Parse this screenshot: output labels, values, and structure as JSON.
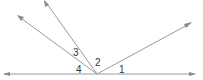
{
  "diagram": {
    "type": "angles-at-a-point",
    "vertex": {
      "x": 97,
      "y": 74
    },
    "line": {
      "x1": 4,
      "y1": 74,
      "x2": 195,
      "y2": 74
    },
    "rays": [
      {
        "name": "ray-left-upper",
        "x": 18,
        "y": 16
      },
      {
        "name": "ray-steep",
        "x": 45,
        "y": 1
      },
      {
        "name": "ray-right",
        "x": 191,
        "y": 23
      }
    ],
    "labels": [
      {
        "text": "1",
        "x": 119,
        "y": 73
      },
      {
        "text": "2",
        "x": 95,
        "y": 66
      },
      {
        "text": "3",
        "x": 73,
        "y": 56
      },
      {
        "text": "4",
        "x": 76,
        "y": 73
      }
    ],
    "colors": {
      "line": "#9a9a9a",
      "text": "#333333"
    }
  }
}
